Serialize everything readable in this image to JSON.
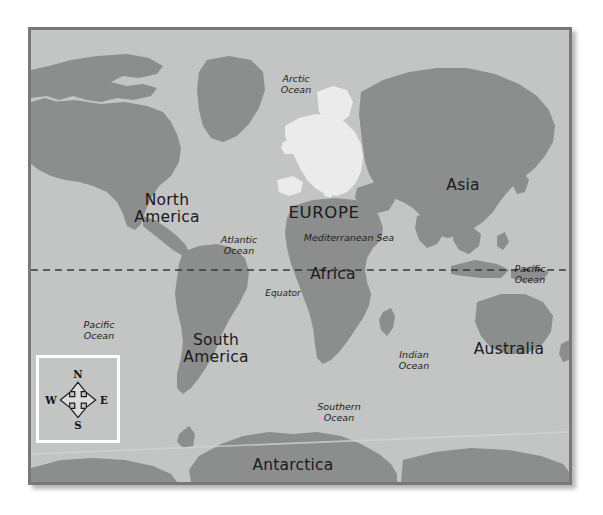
{
  "map": {
    "title": "World Map",
    "colors": {
      "ocean": "#c3c4c4",
      "land": "#8c8d8d",
      "europe_highlight": "#ebebeb",
      "frame": "#787878",
      "label_text": "#1a1a1a",
      "compass_border": "#ffffff",
      "equator_line": "#3a3a3a"
    },
    "continents": [
      {
        "name": "north-america",
        "label": "North\nAmerica",
        "line1": "North",
        "line2": "America"
      },
      {
        "name": "south-america",
        "label": "South\nAmerica",
        "line1": "South",
        "line2": "America"
      },
      {
        "name": "europe",
        "label": "EUROPE",
        "line1": "EUROPE",
        "line2": ""
      },
      {
        "name": "africa",
        "label": "Africa",
        "line1": "Africa",
        "line2": ""
      },
      {
        "name": "asia",
        "label": "Asia",
        "line1": "Asia",
        "line2": ""
      },
      {
        "name": "australia",
        "label": "Australia",
        "line1": "Australia",
        "line2": ""
      },
      {
        "name": "antarctica",
        "label": "Antarctica",
        "line1": "Antarctica",
        "line2": ""
      }
    ],
    "oceans": [
      {
        "name": "arctic-ocean",
        "line1": "Arctic",
        "line2": "Ocean"
      },
      {
        "name": "atlantic-ocean",
        "line1": "Atlantic",
        "line2": "Ocean"
      },
      {
        "name": "pacific-ocean-west",
        "line1": "Pacific",
        "line2": "Ocean"
      },
      {
        "name": "pacific-ocean-east",
        "line1": "Pacific",
        "line2": "Ocean"
      },
      {
        "name": "indian-ocean",
        "line1": "Indian",
        "line2": "Ocean"
      },
      {
        "name": "southern-ocean",
        "line1": "Southern",
        "line2": "Ocean"
      }
    ],
    "seas": [
      {
        "name": "mediterranean-sea",
        "label": "Mediterranean Sea"
      }
    ],
    "lines": [
      {
        "name": "equator",
        "label": "Equator",
        "style": "dashed"
      }
    ],
    "compass": {
      "north": "N",
      "south": "S",
      "east": "E",
      "west": "W"
    }
  }
}
